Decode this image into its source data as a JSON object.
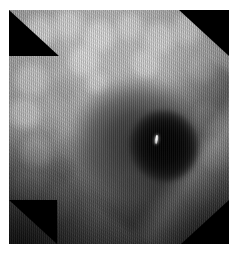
{
  "viewer": {
    "background_color": "#ffffff",
    "image": {
      "name": "endoscopic-frame",
      "modality": "endoscopy",
      "color_mode": "grayscale",
      "aperture_shape": "octagonal",
      "mask_color": "#000000",
      "frame": {
        "x": 9,
        "y": 10,
        "width": 220,
        "height": 234
      },
      "regions": [
        {
          "name": "mucosa-wall",
          "description": "Mottled nodular mucosal surface filling the upper and left portion of the frame",
          "tone": "#a0a0a0"
        },
        {
          "name": "lumen-outer",
          "description": "Large oval mid-gray lumen recess in the centre of the frame",
          "tone": "#3a3a3a"
        },
        {
          "name": "lumen-core",
          "description": "Deep black lumen opening right of centre",
          "tone": "#050505"
        },
        {
          "name": "mucosal-fold",
          "description": "Diagonal fold running from upper-right toward lower-centre",
          "tone": "#2a2a2a"
        },
        {
          "name": "specular-highlight",
          "description": "Small bright light reflection inside the dark lumen",
          "tone": "#ffffff"
        }
      ],
      "corner_masks": [
        {
          "name": "corner-mask-top-left",
          "position": "top-left"
        },
        {
          "name": "corner-mask-top-right",
          "position": "top-right"
        },
        {
          "name": "corner-mask-bottom-left",
          "position": "bottom-left"
        },
        {
          "name": "corner-mask-bottom-right",
          "position": "bottom-right"
        }
      ]
    }
  }
}
